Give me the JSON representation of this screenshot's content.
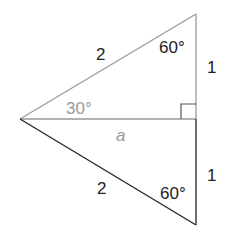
{
  "diagram": {
    "colors": {
      "upper_lines": "#999999",
      "lower_lines": "#222222",
      "light_text": "#999999",
      "dark_text": "#222222",
      "background": "#ffffff"
    },
    "vertices": {
      "left": [
        20,
        119
      ],
      "top": [
        196,
        14
      ],
      "bottom": [
        196,
        225
      ],
      "foot": [
        196,
        119
      ]
    },
    "labels": {
      "upper_hypotenuse": "2",
      "lower_hypotenuse": "2",
      "upper_angle": "60°",
      "lower_angle": "60°",
      "left_angle": "30°",
      "altitude": "a",
      "upper_vertical_side": "1",
      "lower_vertical_side": "1"
    }
  }
}
